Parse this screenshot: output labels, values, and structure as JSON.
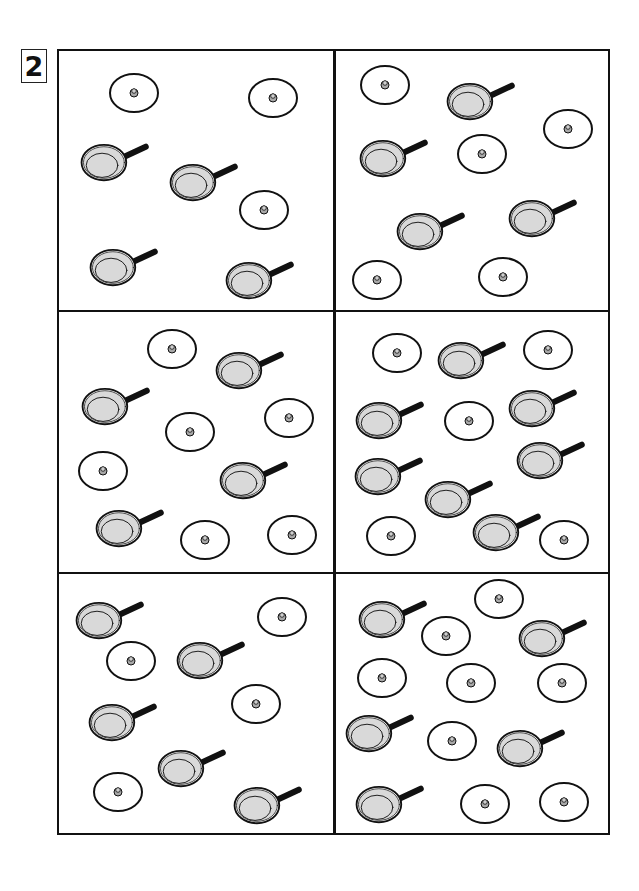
{
  "exercise": {
    "number": "2",
    "colors": {
      "ink": "#111111",
      "pan_fill": "#d9d9d9",
      "lid_knob": "#a8a8a8",
      "background": "#ffffff"
    }
  },
  "cells": [
    {
      "id": 1,
      "pan_count": 4,
      "lid_count": 3,
      "pans": [
        [
          44,
          110
        ],
        [
          133,
          130
        ],
        [
          53,
          215
        ],
        [
          189,
          228
        ]
      ],
      "lids": [
        [
          75,
          42
        ],
        [
          214,
          47
        ],
        [
          205,
          159
        ]
      ]
    },
    {
      "id": 2,
      "pan_count": 4,
      "lid_count": 5,
      "pans": [
        [
          134,
          49
        ],
        [
          47,
          106
        ],
        [
          84,
          179
        ],
        [
          196,
          166
        ]
      ],
      "lids": [
        [
          50,
          34
        ],
        [
          233,
          78
        ],
        [
          147,
          103
        ],
        [
          42,
          229
        ],
        [
          168,
          226
        ]
      ]
    },
    {
      "id": 3,
      "pan_count": 4,
      "lid_count": 6,
      "pans": [
        [
          179,
          57
        ],
        [
          45,
          93
        ],
        [
          183,
          167
        ],
        [
          59,
          215
        ]
      ],
      "lids": [
        [
          113,
          37
        ],
        [
          230,
          106
        ],
        [
          131,
          120
        ],
        [
          44,
          159
        ],
        [
          146,
          228
        ],
        [
          233,
          223
        ]
      ]
    },
    {
      "id": 4,
      "pan_count": 7,
      "lid_count": 5,
      "pans": [
        [
          125,
          47
        ],
        [
          43,
          107
        ],
        [
          196,
          95
        ],
        [
          42,
          163
        ],
        [
          204,
          147
        ],
        [
          112,
          186
        ],
        [
          160,
          219
        ]
      ],
      "lids": [
        [
          62,
          41
        ],
        [
          213,
          38
        ],
        [
          134,
          109
        ],
        [
          56,
          224
        ],
        [
          229,
          228
        ]
      ]
    },
    {
      "id": 5,
      "pan_count": 5,
      "lid_count": 4,
      "pans": [
        [
          39,
          45
        ],
        [
          140,
          85
        ],
        [
          52,
          147
        ],
        [
          121,
          193
        ],
        [
          197,
          230
        ]
      ],
      "lids": [
        [
          223,
          43
        ],
        [
          72,
          87
        ],
        [
          197,
          130
        ],
        [
          59,
          218
        ]
      ]
    },
    {
      "id": 6,
      "pan_count": 5,
      "lid_count": 8,
      "pans": [
        [
          46,
          44
        ],
        [
          206,
          63
        ],
        [
          33,
          158
        ],
        [
          184,
          173
        ],
        [
          43,
          229
        ]
      ],
      "lids": [
        [
          164,
          25
        ],
        [
          111,
          62
        ],
        [
          47,
          104
        ],
        [
          136,
          109
        ],
        [
          227,
          109
        ],
        [
          117,
          167
        ],
        [
          150,
          230
        ],
        [
          229,
          228
        ]
      ]
    }
  ]
}
